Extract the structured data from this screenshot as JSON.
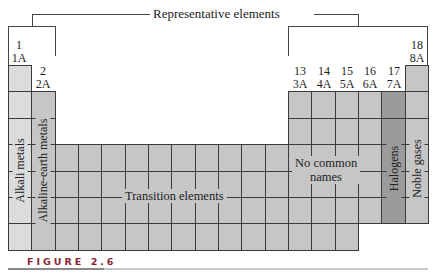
{
  "title": "Representative elements",
  "groups": [
    {
      "num": "1",
      "old": "1A"
    },
    {
      "num": "2",
      "old": "2A"
    },
    {
      "num": "13",
      "old": "3A"
    },
    {
      "num": "14",
      "old": "4A"
    },
    {
      "num": "15",
      "old": "5A"
    },
    {
      "num": "16",
      "old": "6A"
    },
    {
      "num": "17",
      "old": "7A"
    },
    {
      "num": "18",
      "old": "8A"
    }
  ],
  "regions": {
    "alkali": "Alkali metals",
    "alkaline_earth": "Alkaline-earth metals",
    "transition": "Transition elements",
    "no_common_1": "No common",
    "no_common_2": "names",
    "halogens": "Halogens",
    "noble": "Noble gases"
  },
  "colors": {
    "alkali": "#dcdcdc",
    "general": "#c6c6c6",
    "halogens": "#9b9b9b",
    "figure_label": "#8a2434"
  },
  "figure_label": "FIGURE 2.6"
}
